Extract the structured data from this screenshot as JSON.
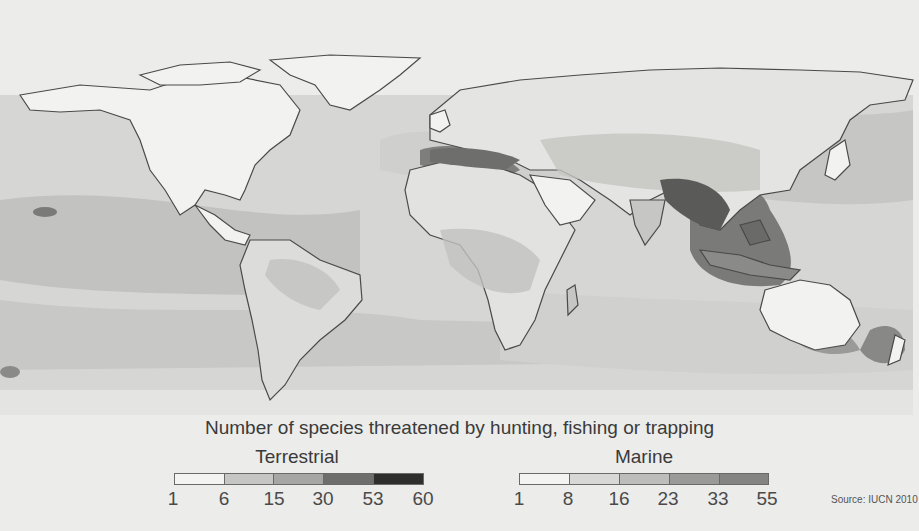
{
  "map": {
    "projection": "world",
    "palette": {
      "background": "#ececea",
      "land_low": "#f2f2f0",
      "ocean_low": "#dcdcda",
      "level2": "#c4c4c2",
      "level3": "#a9a9a7",
      "level4": "#7d7d7b",
      "level5": "#3c3c3a",
      "coastline": "#4a4a4a"
    }
  },
  "title": "Number of species threatened by hunting, fishing or trapping",
  "legends": {
    "terrestrial": {
      "label": "Terrestrial",
      "ticks": [
        "1",
        "6",
        "15",
        "30",
        "53",
        "60"
      ],
      "colors": [
        "#f4f4f2",
        "#c6c6c4",
        "#a6a6a4",
        "#6e6e6c",
        "#2e2e2c"
      ]
    },
    "marine": {
      "label": "Marine",
      "ticks": [
        "1",
        "8",
        "16",
        "23",
        "33",
        "55"
      ],
      "colors": [
        "#f4f4f2",
        "#d8d8d6",
        "#bdbdbb",
        "#9a9a98",
        "#848482"
      ]
    }
  },
  "source": "Source: IUCN 2010"
}
